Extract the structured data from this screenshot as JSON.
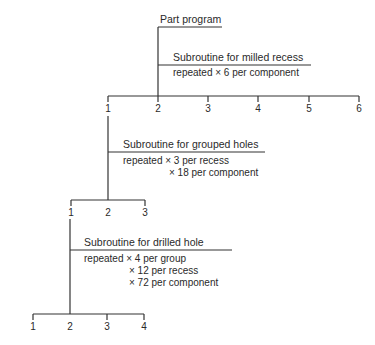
{
  "root": {
    "title": "Part program"
  },
  "levels": [
    {
      "title": "Subroutine for milled recess",
      "repeats": [
        "repeated × 6 per component"
      ],
      "branches": [
        "1",
        "2",
        "3",
        "4",
        "5",
        "6"
      ]
    },
    {
      "title": "Subroutine for grouped holes",
      "repeats": [
        "repeated × 3 per recess",
        "× 18 per component"
      ],
      "branches": [
        "1",
        "2",
        "3"
      ]
    },
    {
      "title": "Subroutine for drilled hole",
      "repeats": [
        "repeated × 4 per group",
        "× 12 per recess",
        "× 72 per component"
      ],
      "branches": [
        "1",
        "2",
        "3",
        "4"
      ]
    }
  ]
}
